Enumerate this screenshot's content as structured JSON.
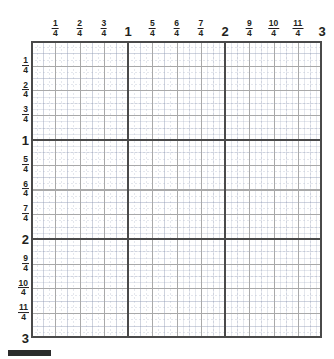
{
  "figure": {
    "type": "fraction-number-grid",
    "range_min": 0,
    "range_max": 3,
    "subdivision": "quarters",
    "colors": {
      "unit_line": "#4a4a4a",
      "quarter_line": "#a9a9a9",
      "sub_line": "#96a0b9",
      "label_text": "#231f20",
      "background": "#ffffff",
      "bottom_bar": "#2b2b2b"
    }
  },
  "chart_data": {
    "type": "table",
    "title": "",
    "xlabel": "",
    "ylabel": "",
    "xlim": [
      0,
      3
    ],
    "ylim": [
      0,
      3
    ],
    "grid": true,
    "legend": false,
    "x_tick_labels": [
      "1/4",
      "2/4",
      "3/4",
      "1",
      "5/4",
      "6/4",
      "7/4",
      "2",
      "9/4",
      "10/4",
      "11/4",
      "3"
    ],
    "y_tick_labels": [
      "1/4",
      "2/4",
      "3/4",
      "1",
      "5/4",
      "6/4",
      "7/4",
      "2",
      "9/4",
      "10/4",
      "11/4",
      "3"
    ],
    "x_tick_values": [
      0.25,
      0.5,
      0.75,
      1,
      1.25,
      1.5,
      1.75,
      2,
      2.25,
      2.5,
      2.75,
      3
    ],
    "y_tick_values": [
      0.25,
      0.5,
      0.75,
      1,
      1.25,
      1.5,
      1.75,
      2,
      2.25,
      2.5,
      2.75,
      3
    ],
    "series": []
  },
  "top_axis": {
    "name": "horizontal-axis",
    "ticks": [
      {
        "kind": "fraction",
        "num": "1",
        "den": "4",
        "text": "1/4",
        "value": 0.25
      },
      {
        "kind": "fraction",
        "num": "2",
        "den": "4",
        "text": "2/4",
        "value": 0.5
      },
      {
        "kind": "fraction",
        "num": "3",
        "den": "4",
        "text": "3/4",
        "value": 0.75
      },
      {
        "kind": "whole",
        "text": "1",
        "value": 1
      },
      {
        "kind": "fraction",
        "num": "5",
        "den": "4",
        "text": "5/4",
        "value": 1.25
      },
      {
        "kind": "fraction",
        "num": "6",
        "den": "4",
        "text": "6/4",
        "value": 1.5
      },
      {
        "kind": "fraction",
        "num": "7",
        "den": "4",
        "text": "7/4",
        "value": 1.75
      },
      {
        "kind": "whole",
        "text": "2",
        "value": 2
      },
      {
        "kind": "fraction",
        "num": "9",
        "den": "4",
        "text": "9/4",
        "value": 2.25
      },
      {
        "kind": "fraction",
        "num": "10",
        "den": "4",
        "text": "10/4",
        "value": 2.5
      },
      {
        "kind": "fraction",
        "num": "11",
        "den": "4",
        "text": "11/4",
        "value": 2.75
      },
      {
        "kind": "whole",
        "text": "3",
        "value": 3
      }
    ]
  },
  "left_axis": {
    "name": "vertical-axis",
    "ticks": [
      {
        "kind": "fraction",
        "num": "1",
        "den": "4",
        "text": "1/4",
        "value": 0.25
      },
      {
        "kind": "fraction",
        "num": "2",
        "den": "4",
        "text": "2/4",
        "value": 0.5
      },
      {
        "kind": "fraction",
        "num": "3",
        "den": "4",
        "text": "3/4",
        "value": 0.75
      },
      {
        "kind": "whole",
        "text": "1",
        "value": 1
      },
      {
        "kind": "fraction",
        "num": "5",
        "den": "4",
        "text": "5/4",
        "value": 1.25
      },
      {
        "kind": "fraction",
        "num": "6",
        "den": "4",
        "text": "6/4",
        "value": 1.5
      },
      {
        "kind": "fraction",
        "num": "7",
        "den": "4",
        "text": "7/4",
        "value": 1.75
      },
      {
        "kind": "whole",
        "text": "2",
        "value": 2
      },
      {
        "kind": "fraction",
        "num": "9",
        "den": "4",
        "text": "9/4",
        "value": 2.25
      },
      {
        "kind": "fraction",
        "num": "10",
        "den": "4",
        "text": "10/4",
        "value": 2.5
      },
      {
        "kind": "fraction",
        "num": "11",
        "den": "4",
        "text": "11/4",
        "value": 2.75
      },
      {
        "kind": "whole",
        "text": "3",
        "value": 3
      }
    ]
  },
  "unit_lines": {
    "vertical_values": [
      1,
      2
    ],
    "horizontal_values": [
      1,
      2
    ]
  }
}
